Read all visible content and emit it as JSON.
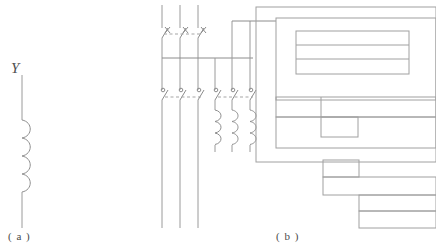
{
  "figure": {
    "caption_a": "( a )",
    "caption_b": "( b )",
    "inductor_label": "Y"
  },
  "panel_a": {
    "name": "inductor-symbol",
    "description": "single winding coil symbol with vertical lead wires",
    "label": "Y",
    "caption": "( a )",
    "lead_top_y": 75,
    "lead_bottom_y": 228,
    "coil_turns": 4,
    "coil_top_y": 120,
    "coil_bottom_y": 192,
    "x_position": 22,
    "coil_radius": 9
  },
  "panel_b": {
    "name": "three-phase-distribution-circuit",
    "caption": "( b )",
    "phase_count": 3,
    "bus_line_y": 58,
    "left_group": {
      "name": "main-feeder-lines",
      "line_x": [
        162,
        180,
        198
      ],
      "top_y": 5,
      "bottom_y": 228,
      "upper_switch_y": 30,
      "lower_switch_y": 92
    },
    "right_group": {
      "name": "branch-motor-lines",
      "line_x": [
        215,
        232,
        250
      ],
      "top_y": 58,
      "switch_y": 92,
      "coil_top_y": 110,
      "coil_bottom_y": 145
    },
    "switch_banks": [
      {
        "name": "upper-disconnect-switch-bank",
        "y": 30,
        "type": "fused-disconnect",
        "poles": 3,
        "linked": true
      },
      {
        "name": "lower-contactor-bank-left",
        "y": 92,
        "type": "contactor",
        "poles": 3,
        "linked": true
      },
      {
        "name": "lower-contactor-bank-right",
        "y": 92,
        "type": "contactor",
        "poles": 3,
        "linked": true
      }
    ],
    "coils": {
      "name": "overload-relay-coils",
      "count": 3,
      "turns": 3
    },
    "enclosure_blocks": [
      {
        "name": "outer-enclosure",
        "x": 256,
        "y": 7,
        "w": 180,
        "h": 155
      },
      {
        "name": "inner-upper-panel",
        "x": 276,
        "y": 18,
        "w": 160,
        "h": 82
      },
      {
        "name": "display-window-outer",
        "x": 296,
        "y": 31,
        "w": 113,
        "h": 43
      },
      {
        "name": "display-row-divider-1",
        "x": 296,
        "y": 45,
        "w": 113,
        "h": 0
      },
      {
        "name": "display-row-divider-2",
        "x": 296,
        "y": 58,
        "w": 113,
        "h": 0
      },
      {
        "name": "mid-panel-row",
        "x": 276,
        "y": 97,
        "w": 160,
        "h": 20
      },
      {
        "name": "mid-panel-cell",
        "x": 276,
        "y": 97,
        "w": 45,
        "h": 20
      },
      {
        "name": "mid-inset-box",
        "x": 329,
        "y": 114,
        "w": 37,
        "h": 20
      },
      {
        "name": "mid-lower-band",
        "x": 276,
        "y": 114,
        "w": 160,
        "h": 34
      },
      {
        "name": "lower-step-box-1",
        "x": 329,
        "y": 162,
        "w": 36,
        "h": 17
      },
      {
        "name": "lower-step-band-2",
        "x": 329,
        "y": 179,
        "w": 107,
        "h": 18
      },
      {
        "name": "lower-step-band-3",
        "x": 365,
        "y": 197,
        "w": 71,
        "h": 15
      },
      {
        "name": "lower-step-band-4",
        "x": 365,
        "y": 212,
        "w": 71,
        "h": 16
      }
    ],
    "connection_wires": [
      {
        "name": "main-bus-horizontal",
        "from_x": 162,
        "to_x": 253,
        "y": 58
      },
      {
        "name": "riser-to-enclosure",
        "from_y": 58,
        "to_y": 21,
        "x": 253
      },
      {
        "name": "enclosure-top-feed",
        "from_x": 235,
        "to_x": 276,
        "y": 21
      }
    ]
  },
  "colors": {
    "line": "#9a9a9a",
    "box": "#a0a0a0",
    "text": "#4a4a4a",
    "background": "#ffffff"
  }
}
